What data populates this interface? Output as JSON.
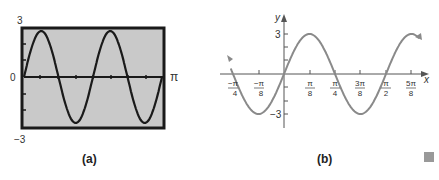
{
  "chart_data": [
    {
      "panel": "(a)",
      "type": "line",
      "style": "graphing-calculator screen",
      "function_samples": "y = 3 sin(4x)",
      "x_range": [
        0,
        3.1416
      ],
      "x_labels": {
        "left": "0",
        "right": "π"
      },
      "y_labels": {
        "top": "3",
        "bottom": "−3"
      },
      "ylim": [
        -3,
        3
      ],
      "x_tick_count": 8,
      "y_tick_count": 6,
      "background": "#c8c8c8",
      "curve_color": "#222222",
      "caption": "(a)"
    },
    {
      "panel": "(b)",
      "type": "line",
      "function_samples": "y = 3 sin(4x)",
      "x_range": [
        -0.85,
        2.05
      ],
      "xlabel": "x",
      "ylabel": "y",
      "x_ticks": [
        {
          "num": "−π",
          "den": "4"
        },
        {
          "num": "−π",
          "den": "8"
        },
        {
          "num": "π",
          "den": "8"
        },
        {
          "num": "π",
          "den": "4"
        },
        {
          "num": "3π",
          "den": "8"
        },
        {
          "num": "π",
          "den": "2"
        },
        {
          "num": "5π",
          "den": "8"
        }
      ],
      "y_ticks": [
        "3",
        "−3"
      ],
      "ylim": [
        -3,
        3
      ],
      "curve_color": "#8a8a8a",
      "caption": "(b)"
    }
  ],
  "captions": {
    "a": "(a)",
    "b": "(b)"
  },
  "labels": {
    "a_top": "3",
    "a_zero": "0",
    "a_bottom": "−3",
    "a_pi": "π",
    "b_y": "y",
    "b_x": "x",
    "b_three": "3",
    "b_neg_three": "−3"
  }
}
